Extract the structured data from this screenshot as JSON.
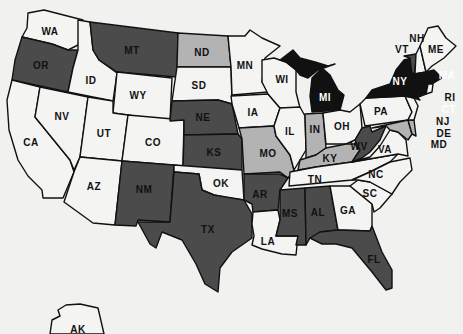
{
  "colors": {
    "background": "#f1f1f0",
    "none": "#f4f4f3",
    "light": "#b3b3b3",
    "dark": "#4b4b4b",
    "black": "#111111",
    "outline": "#111111"
  },
  "map": {
    "title": "United States",
    "categories": [
      "none",
      "light",
      "dark",
      "black"
    ],
    "states": [
      {
        "code": "WA",
        "fill": "none",
        "lx": 50,
        "ly": 32
      },
      {
        "code": "OR",
        "fill": "dark",
        "lx": 41,
        "ly": 66
      },
      {
        "code": "CA",
        "fill": "none",
        "lx": 31,
        "ly": 143
      },
      {
        "code": "ID",
        "fill": "none",
        "lx": 91,
        "ly": 81
      },
      {
        "code": "NV",
        "fill": "none",
        "lx": 62,
        "ly": 117
      },
      {
        "code": "MT",
        "fill": "dark",
        "lx": 132,
        "ly": 51
      },
      {
        "code": "WY",
        "fill": "none",
        "lx": 138,
        "ly": 96
      },
      {
        "code": "UT",
        "fill": "none",
        "lx": 104,
        "ly": 134
      },
      {
        "code": "CO",
        "fill": "none",
        "lx": 153,
        "ly": 143
      },
      {
        "code": "AZ",
        "fill": "none",
        "lx": 94,
        "ly": 187
      },
      {
        "code": "NM",
        "fill": "dark",
        "lx": 144,
        "ly": 190
      },
      {
        "code": "ND",
        "fill": "light",
        "lx": 202,
        "ly": 53
      },
      {
        "code": "SD",
        "fill": "none",
        "lx": 199,
        "ly": 86
      },
      {
        "code": "NE",
        "fill": "dark",
        "lx": 203,
        "ly": 118
      },
      {
        "code": "KS",
        "fill": "dark",
        "lx": 214,
        "ly": 153
      },
      {
        "code": "OK",
        "fill": "none",
        "lx": 221,
        "ly": 184
      },
      {
        "code": "TX",
        "fill": "dark",
        "lx": 208,
        "ly": 230
      },
      {
        "code": "MN",
        "fill": "none",
        "lx": 245,
        "ly": 66
      },
      {
        "code": "IA",
        "fill": "none",
        "lx": 253,
        "ly": 113
      },
      {
        "code": "MO",
        "fill": "light",
        "lx": 268,
        "ly": 154
      },
      {
        "code": "AR",
        "fill": "dark",
        "lx": 260,
        "ly": 195
      },
      {
        "code": "LA",
        "fill": "none",
        "lx": 268,
        "ly": 242
      },
      {
        "code": "WI",
        "fill": "none",
        "lx": 282,
        "ly": 80
      },
      {
        "code": "IL",
        "fill": "none",
        "lx": 290,
        "ly": 132
      },
      {
        "code": "MS",
        "fill": "dark",
        "lx": 290,
        "ly": 214
      },
      {
        "code": "MI",
        "fill": "black",
        "lx": 325,
        "ly": 98
      },
      {
        "code": "IN",
        "fill": "light",
        "lx": 315,
        "ly": 130
      },
      {
        "code": "KY",
        "fill": "light",
        "lx": 330,
        "ly": 159
      },
      {
        "code": "TN",
        "fill": "none",
        "lx": 315,
        "ly": 180
      },
      {
        "code": "AL",
        "fill": "dark",
        "lx": 318,
        "ly": 213
      },
      {
        "code": "OH",
        "fill": "none",
        "lx": 342,
        "ly": 127
      },
      {
        "code": "GA",
        "fill": "none",
        "lx": 348,
        "ly": 211
      },
      {
        "code": "FL",
        "fill": "dark",
        "lx": 374,
        "ly": 260
      },
      {
        "code": "WV",
        "fill": "dark",
        "lx": 359,
        "ly": 147
      },
      {
        "code": "VA",
        "fill": "none",
        "lx": 385,
        "ly": 150
      },
      {
        "code": "NC",
        "fill": "none",
        "lx": 376,
        "ly": 175
      },
      {
        "code": "SC",
        "fill": "none",
        "lx": 370,
        "ly": 194
      },
      {
        "code": "PA",
        "fill": "none",
        "lx": 381,
        "ly": 112
      },
      {
        "code": "NY",
        "fill": "black",
        "lx": 400,
        "ly": 82
      },
      {
        "code": "VT",
        "fill": "dark",
        "lx": 402,
        "ly": 50
      },
      {
        "code": "NH",
        "fill": "none",
        "lx": 417,
        "ly": 39
      },
      {
        "code": "ME",
        "fill": "none",
        "lx": 436,
        "ly": 50
      },
      {
        "code": "MA",
        "fill": "black",
        "lx": 447,
        "ly": 76
      },
      {
        "code": "RI",
        "fill": "none",
        "lx": 450,
        "ly": 98
      },
      {
        "code": "CT",
        "fill": "black",
        "lx": 449,
        "ly": 110
      },
      {
        "code": "NJ",
        "fill": "none",
        "lx": 443,
        "ly": 122
      },
      {
        "code": "DE",
        "fill": "light",
        "lx": 444,
        "ly": 134
      },
      {
        "code": "MD",
        "fill": "light",
        "lx": 439,
        "ly": 145
      },
      {
        "code": "AK",
        "fill": "none",
        "lx": 78,
        "ly": 330
      }
    ]
  }
}
